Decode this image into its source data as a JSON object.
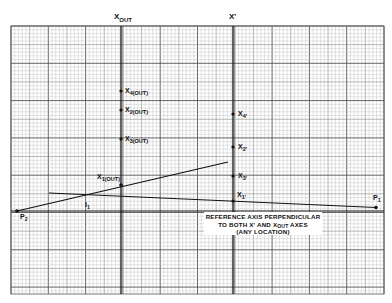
{
  "diagram": {
    "type": "graph-paper construction",
    "grid": {
      "left": 11,
      "top": 26,
      "right": 384,
      "bottom": 294,
      "minor": 3.73,
      "major_every": 10
    },
    "colors": {
      "paper": "#ffffff",
      "grid_minor": "#b8b8b8",
      "grid_major": "#555555",
      "ink": "#111111"
    },
    "axes": [
      {
        "id": "x_out",
        "label": "X",
        "subscript": "OUT",
        "x": 121
      },
      {
        "id": "x_prime",
        "label": "X'",
        "subscript": "",
        "x": 233
      }
    ],
    "x_out_points": [
      {
        "label": "X",
        "sub": "4(OUT)",
        "y": 91
      },
      {
        "label": "X",
        "sub": "2(OUT)",
        "y": 110
      },
      {
        "label": "X",
        "sub": "3(OUT)",
        "y": 139
      },
      {
        "label": "X",
        "sub": "1(OUT)",
        "y": 185
      }
    ],
    "x_prime_points": [
      {
        "label": "X",
        "sub": "4'",
        "y": 114
      },
      {
        "label": "X",
        "sub": "2'",
        "y": 147
      },
      {
        "label": "X",
        "sub": "3'",
        "y": 176
      },
      {
        "label": "X",
        "sub": "1'",
        "y": 201
      }
    ],
    "points": {
      "p1": {
        "label": "P",
        "sub": "1",
        "x": 376,
        "y": 207
      },
      "p2": {
        "label": "P",
        "sub": "2",
        "x": 17,
        "y": 211
      },
      "i1": {
        "label": "I",
        "sub": "1"
      }
    },
    "reference_axis_y": 211,
    "note": {
      "line1": "REFERENCE AXIS PERPENDICULAR",
      "line2_a": "TO BOTH X' AND X",
      "line2_sub": "OUT",
      "line2_b": " AXES",
      "line3": "(ANY LOCATION)"
    }
  }
}
